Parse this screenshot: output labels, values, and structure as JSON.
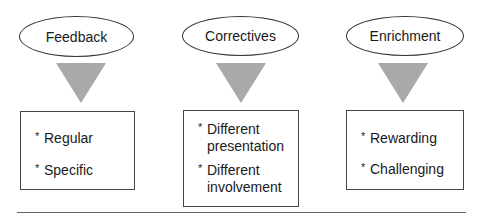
{
  "columns": [
    {
      "title": "Feedback",
      "items": [
        {
          "bullet": "*",
          "lines": [
            "Regular"
          ]
        },
        {
          "bullet": "*",
          "lines": [
            "Specific"
          ]
        }
      ]
    },
    {
      "title": "Correctives",
      "items": [
        {
          "bullet": "*",
          "lines": [
            "Different",
            "presentation"
          ]
        },
        {
          "bullet": "*",
          "lines": [
            "Different",
            "involvement"
          ]
        }
      ]
    },
    {
      "title": "Enrichment",
      "items": [
        {
          "bullet": "*",
          "lines": [
            "Rewarding"
          ]
        },
        {
          "bullet": "*",
          "lines": [
            "Challenging"
          ]
        }
      ]
    }
  ],
  "colors": {
    "arrow": "#a9a9a9",
    "outline": "#333333",
    "rule": "#666666"
  }
}
